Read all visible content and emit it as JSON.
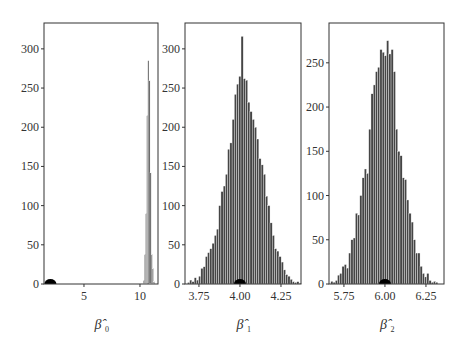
{
  "chart_data": [
    {
      "type": "bar",
      "title": "",
      "xlabel": "β̂0",
      "xlabel_main": "β̂",
      "xlabel_sub": "0",
      "ylabel": "",
      "xlim": [
        1.43,
        11.61
      ],
      "ylim": [
        0,
        333
      ],
      "xticks": [
        5,
        10
      ],
      "xtick_labels": [
        "5",
        "10"
      ],
      "yticks": [
        0,
        50,
        100,
        150,
        200,
        250,
        300
      ],
      "ytick_labels": [
        "0",
        "50",
        "100",
        "150",
        "200",
        "250",
        "300"
      ],
      "grid": false,
      "true_value_marker": 2,
      "bin_start": 10.3,
      "bin_width": 0.1,
      "values": [
        5,
        38,
        90,
        215,
        285,
        260,
        142,
        38,
        20,
        3
      ]
    },
    {
      "type": "bar",
      "title": "",
      "xlabel": "β̂1",
      "xlabel_main": "β̂",
      "xlabel_sub": "1",
      "ylabel": "",
      "xlim": [
        3.665,
        4.372
      ],
      "ylim": [
        0,
        333
      ],
      "xticks": [
        3.75,
        4.0,
        4.25
      ],
      "xtick_labels": [
        "3.75",
        "4.00",
        "4.25"
      ],
      "yticks": [
        0,
        50,
        100,
        150,
        200,
        250,
        300
      ],
      "ytick_labels": [
        "0",
        "50",
        "100",
        "150",
        "200",
        "250",
        "300"
      ],
      "grid": false,
      "true_value_marker": 4.0,
      "bin_start": 3.68,
      "bin_width": 0.0136,
      "values": [
        2,
        5,
        3,
        8,
        5,
        10,
        20,
        22,
        35,
        40,
        45,
        52,
        62,
        70,
        100,
        118,
        125,
        140,
        172,
        180,
        210,
        242,
        255,
        265,
        316,
        262,
        260,
        232,
        220,
        210,
        200,
        185,
        160,
        152,
        140,
        112,
        100,
        78,
        62,
        45,
        42,
        35,
        28,
        18,
        12,
        10,
        6,
        3,
        2,
        3,
        1
      ]
    },
    {
      "type": "bar",
      "title": "",
      "xlabel": "β̂2",
      "xlabel_main": "β̂",
      "xlabel_sub": "2",
      "ylabel": "",
      "xlim": [
        5.659,
        6.36
      ],
      "ylim": [
        0,
        295
      ],
      "xticks": [
        5.75,
        6.0,
        6.25
      ],
      "xtick_labels": [
        "5.75",
        "6.00",
        "6.25"
      ],
      "yticks": [
        0,
        50,
        100,
        150,
        200,
        250
      ],
      "ytick_labels": [
        "0",
        "50",
        "100",
        "150",
        "200",
        "250"
      ],
      "grid": false,
      "true_value_marker": 6.0,
      "bin_start": 5.67,
      "bin_width": 0.0136,
      "values": [
        3,
        2,
        4,
        10,
        12,
        20,
        22,
        18,
        35,
        50,
        52,
        80,
        78,
        100,
        120,
        130,
        125,
        175,
        215,
        225,
        240,
        245,
        265,
        262,
        258,
        275,
        260,
        265,
        240,
        175,
        150,
        145,
        120,
        118,
        95,
        80,
        70,
        50,
        35,
        35,
        20,
        12,
        8,
        12,
        4,
        2,
        3,
        2
      ]
    }
  ],
  "panels": [
    {
      "xlabel_main": "β̂",
      "xlabel_sub": "0"
    },
    {
      "xlabel_main": "β̂",
      "xlabel_sub": "1"
    },
    {
      "xlabel_main": "β̂",
      "xlabel_sub": "2"
    }
  ],
  "colors": {
    "bar": "#454545",
    "bar_edge": "#ffffff",
    "axis": "#333333",
    "marker": "#000000"
  }
}
